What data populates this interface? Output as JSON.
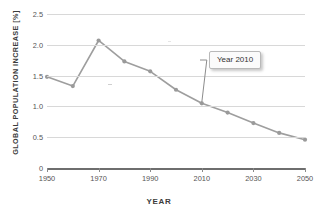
{
  "chart_data": {
    "type": "line",
    "title": "",
    "xlabel": "YEAR",
    "ylabel": "GLOBAL POPULATION INCREASE [%]",
    "x": [
      1950,
      1960,
      1970,
      1980,
      1990,
      2000,
      2010,
      2020,
      2030,
      2040,
      2050
    ],
    "values": [
      1.48,
      1.33,
      2.07,
      1.73,
      1.57,
      1.27,
      1.05,
      0.9,
      0.73,
      0.57,
      0.46
    ],
    "series": [
      {
        "name": "Global population increase",
        "values": [
          1.48,
          1.33,
          2.07,
          1.73,
          1.57,
          1.27,
          1.05,
          0.9,
          0.73,
          0.57,
          0.46
        ]
      }
    ],
    "xlim": [
      1950,
      2050
    ],
    "ylim": [
      0,
      2.5
    ],
    "xticks": [
      1950,
      1970,
      1990,
      2010,
      2030,
      2050
    ],
    "xtick_labels": [
      "1950",
      "1970",
      "1990",
      "2010",
      "2030",
      "2050"
    ],
    "yticks": [
      0,
      0.5,
      1.0,
      1.5,
      2.0,
      2.5
    ],
    "ytick_labels": [
      "0",
      "0.5",
      "1.0",
      "1.5",
      "2.0",
      "2.5"
    ],
    "grid": true,
    "grid_axis": "y",
    "legend": false,
    "legend_position": "none",
    "annotations": [
      {
        "text": "Year 2010",
        "points_to_x": 2010,
        "points_to_y": 1.05
      }
    ],
    "colors": {
      "line": "#9e9e9e",
      "marker": "#9a9a9a",
      "grid": "#d8d8d8",
      "axis": "#6e6e6e",
      "text": "#444444",
      "callout_background": "#fbfbfb",
      "callout_border": "#b9b9b9"
    }
  }
}
